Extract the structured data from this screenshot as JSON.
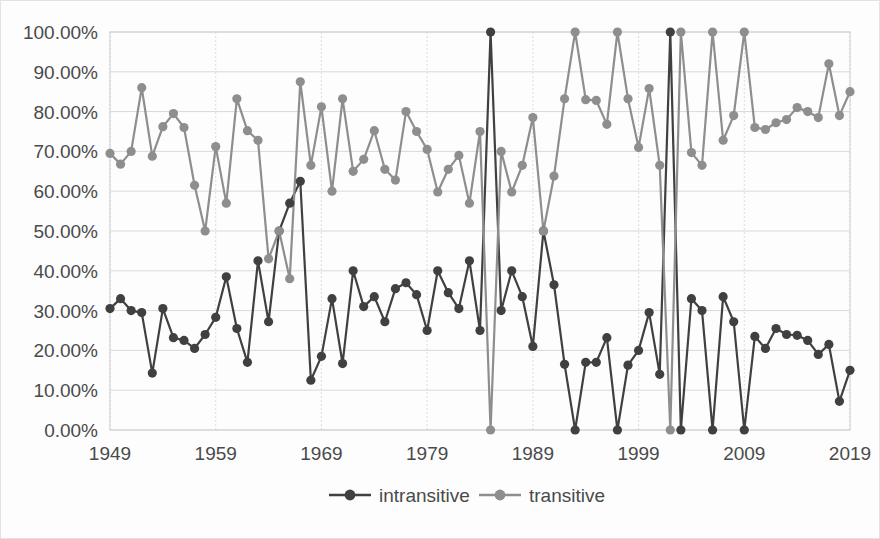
{
  "chart_data": {
    "type": "line",
    "title": "",
    "subtitle": "",
    "xlabel": "",
    "ylabel": "",
    "xlim": [
      1949,
      2019
    ],
    "ylim": [
      0,
      1.0
    ],
    "grid": true,
    "legend_position": "bottom",
    "y_tick_labels": [
      "100.00%",
      "90.00%",
      "80.00%",
      "70.00%",
      "60.00%",
      "50.00%",
      "40.00%",
      "30.00%",
      "20.00%",
      "10.00%",
      "0.00%"
    ],
    "y_tick_values": [
      1.0,
      0.9,
      0.8,
      0.7,
      0.6,
      0.5,
      0.4,
      0.3,
      0.2,
      0.1,
      0.0
    ],
    "x_tick_labels": [
      "1949",
      "1959",
      "1969",
      "1979",
      "1989",
      "1999",
      "2009",
      "2019"
    ],
    "x_tick_values": [
      1949,
      1959,
      1969,
      1979,
      1989,
      1999,
      2009,
      2019
    ],
    "x": [
      1949,
      1950,
      1951,
      1952,
      1953,
      1954,
      1955,
      1956,
      1957,
      1958,
      1959,
      1960,
      1961,
      1962,
      1963,
      1964,
      1965,
      1966,
      1967,
      1968,
      1969,
      1970,
      1971,
      1972,
      1973,
      1974,
      1975,
      1976,
      1977,
      1978,
      1979,
      1980,
      1981,
      1982,
      1983,
      1984,
      1985,
      1986,
      1987,
      1988,
      1989,
      1990,
      1991,
      1992,
      1993,
      1994,
      1995,
      1996,
      1997,
      1998,
      1999,
      2000,
      2001,
      2002,
      2003,
      2004,
      2005,
      2006,
      2007,
      2008,
      2009,
      2010,
      2011,
      2012,
      2013,
      2014,
      2015,
      2016,
      2017,
      2018,
      2019
    ],
    "series": [
      {
        "name": "intransitive",
        "color": "#404040",
        "marker": "circle",
        "values": [
          0.305,
          0.33,
          0.3,
          0.295,
          0.143,
          0.305,
          0.232,
          0.225,
          0.205,
          0.24,
          0.283,
          0.385,
          0.255,
          0.17,
          0.425,
          0.272,
          0.5,
          0.57,
          0.625,
          0.125,
          0.185,
          0.33,
          0.167,
          0.4,
          0.31,
          0.335,
          0.272,
          0.355,
          0.37,
          0.34,
          0.25,
          0.4,
          0.345,
          0.305,
          0.425,
          0.25,
          1.0,
          0.3,
          0.4,
          0.335,
          0.21,
          0.5,
          0.365,
          0.165,
          0.0,
          0.17,
          0.17,
          0.232,
          0.0,
          0.163,
          0.2,
          0.295,
          0.14,
          1.0,
          0.0,
          0.33,
          0.3,
          0.0,
          0.335,
          0.272,
          0.0,
          0.235,
          0.205,
          0.255,
          0.24,
          0.238,
          0.225,
          0.19,
          0.215,
          0.072,
          0.15
        ]
      },
      {
        "name": "transitive",
        "color": "#8e8e8e",
        "marker": "circle",
        "values": [
          0.695,
          0.668,
          0.7,
          0.86,
          0.688,
          0.762,
          0.795,
          0.76,
          0.615,
          0.5,
          0.712,
          0.57,
          0.832,
          0.752,
          0.728,
          0.43,
          0.5,
          0.38,
          0.875,
          0.665,
          0.812,
          0.6,
          0.832,
          0.65,
          0.68,
          0.752,
          0.655,
          0.628,
          0.8,
          0.75,
          0.705,
          0.598,
          0.655,
          0.69,
          0.57,
          0.75,
          0.0,
          0.7,
          0.598,
          0.665,
          0.785,
          0.5,
          0.638,
          0.832,
          1.0,
          0.83,
          0.828,
          0.768,
          1.0,
          0.832,
          0.71,
          0.858,
          0.665,
          0.0,
          1.0,
          0.697,
          0.665,
          1.0,
          0.728,
          0.79,
          1.0,
          0.76,
          0.755,
          0.772,
          0.78,
          0.81,
          0.8,
          0.785,
          0.92,
          0.79,
          0.85
        ]
      }
    ],
    "legend": [
      {
        "label": "intransitive",
        "color": "#404040"
      },
      {
        "label": "transitive",
        "color": "#8e8e8e"
      }
    ]
  }
}
